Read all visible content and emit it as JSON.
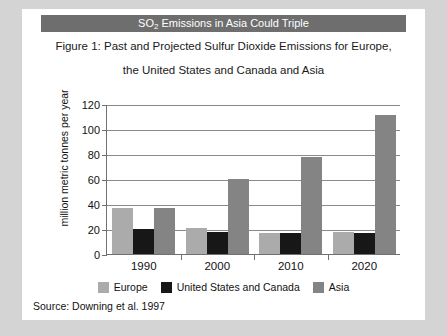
{
  "banner": {
    "text_before": "SO",
    "subscript": "2",
    "text_after": " Emissions in Asia Could Triple",
    "background": "#6e6e6e",
    "color": "#ffffff"
  },
  "caption": {
    "line1": "Figure 1: Past and Projected Sulfur Dioxide Emissions for Europe,",
    "line2": "the United States and Canada and Asia"
  },
  "source": {
    "text": "Source: Downing et al. 1997"
  },
  "legend": {
    "position": "bottom-center",
    "entries": [
      {
        "label": "Europe",
        "color": "#ababab"
      },
      {
        "label": "United States and Canada",
        "color": "#171717"
      },
      {
        "label": "Asia",
        "color": "#848484"
      }
    ]
  },
  "chart_data": {
    "type": "bar",
    "title": "Figure 1: Past and Projected Sulfur Dioxide Emissions for Europe, the United States and Canada and Asia",
    "xlabel": "",
    "ylabel": "million metric tonnes per year",
    "categories": [
      "1990",
      "2000",
      "2010",
      "2020"
    ],
    "series": [
      {
        "name": "Europe",
        "color": "#ababab",
        "values": [
          37,
          21,
          17,
          18
        ]
      },
      {
        "name": "United States and Canada",
        "color": "#171717",
        "values": [
          20,
          18,
          17,
          17
        ]
      },
      {
        "name": "Asia",
        "color": "#848484",
        "values": [
          37,
          60,
          78,
          111
        ]
      }
    ],
    "ylim": [
      0,
      120
    ],
    "yticks": [
      0,
      20,
      40,
      60,
      80,
      100,
      120
    ],
    "ytick_labels": [
      "0",
      "20",
      "40",
      "60",
      "80",
      "100",
      "120"
    ],
    "grid": true,
    "grid_axis": "y",
    "legend_position": "bottom-center",
    "source": "Source: Downing et al. 1997"
  }
}
